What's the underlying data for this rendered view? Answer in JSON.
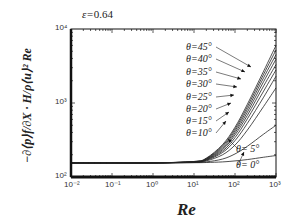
{
  "chart_data": {
    "type": "line",
    "title": "ε=0.64",
    "annotation": "ε=0.64",
    "xlabel": "Re",
    "ylabel": "−(∂⟨p⟩f/∂X)·H/(ρ⟨u⟩²Re)",
    "xscale": "log",
    "yscale": "log",
    "xlim": [
      0.01,
      1000
    ],
    "ylim": [
      100,
      10000
    ],
    "x_ticks": [
      "10^-2",
      "10^-1",
      "10^0",
      "10^1",
      "10^2",
      "10^3"
    ],
    "y_ticks": [
      "10^2",
      "10^3",
      "10^4"
    ],
    "grid": false,
    "legend_position": "inline labels with arrows",
    "x": [
      0.01,
      0.1,
      1,
      10,
      20,
      50,
      100,
      200,
      500,
      1000
    ],
    "series": [
      {
        "name": "θ=0°",
        "values": [
          155,
          155,
          155,
          156,
          157,
          160,
          165,
          172,
          185,
          195
        ]
      },
      {
        "name": "θ=5°",
        "values": [
          155,
          155,
          155,
          157,
          160,
          175,
          205,
          260,
          380,
          500
        ]
      },
      {
        "name": "θ=10°",
        "values": [
          155,
          155,
          155,
          158,
          165,
          200,
          270,
          430,
          900,
          1600
        ]
      },
      {
        "name": "θ=15°",
        "values": [
          155,
          155,
          155,
          159,
          168,
          215,
          310,
          530,
          1200,
          2300
        ]
      },
      {
        "name": "θ=20°",
        "values": [
          155,
          155,
          155,
          160,
          170,
          225,
          340,
          610,
          1450,
          2800
        ]
      },
      {
        "name": "θ=25°",
        "values": [
          155,
          155,
          155,
          160,
          172,
          235,
          370,
          680,
          1700,
          3300
        ]
      },
      {
        "name": "θ=30°",
        "values": [
          155,
          155,
          155,
          161,
          174,
          245,
          395,
          750,
          1950,
          3900
        ]
      },
      {
        "name": "θ=35°",
        "values": [
          155,
          155,
          155,
          161,
          176,
          255,
          420,
          820,
          2200,
          4500
        ]
      },
      {
        "name": "θ=40°",
        "values": [
          155,
          155,
          155,
          162,
          178,
          265,
          445,
          890,
          2450,
          5200
        ]
      },
      {
        "name": "θ=45°",
        "values": [
          155,
          155,
          155,
          162,
          180,
          275,
          470,
          960,
          2700,
          6000
        ]
      }
    ]
  },
  "labels": {
    "epsilon_symbol": "ε=",
    "epsilon_value": "0.64",
    "x_title": "Re",
    "y_title": "−∂⟨p⟩f/∂X · H/ρ⟨u⟩² Re",
    "theta": [
      "θ=45°",
      "θ=40°",
      "θ=35°",
      "θ=30°",
      "θ=25°",
      "θ=20°",
      "θ=15°",
      "θ=10°",
      "θ= 5°",
      "θ= 0°"
    ],
    "x_ticks": [
      "10⁻²",
      "10⁻¹",
      "10⁰",
      "10¹",
      "10²",
      "10³"
    ],
    "y_ticks": [
      "10²",
      "10³",
      "10⁴"
    ]
  },
  "colors": {
    "axis": "#111111",
    "curve": "#222222",
    "text": "#222222"
  }
}
